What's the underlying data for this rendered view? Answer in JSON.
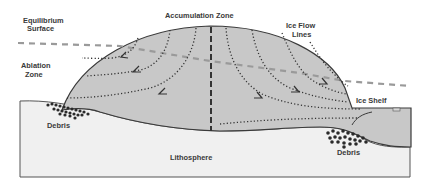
{
  "diagram": {
    "labels": {
      "equilibrium_surface_line1": "Equilibrium",
      "equilibrium_surface_line2": "Surface",
      "accumulation_zone": "Accumulation Zone",
      "ice_flow_lines_line1": "Ice Flow",
      "ice_flow_lines_line2": "Lines",
      "ablation_zone_line1": "Ablation",
      "ablation_zone_line2": "Zone",
      "ice_shelf": "Ice Shelf",
      "debris_left": "Debris",
      "debris_right": "Debris",
      "lithosphere": "Lithosphere"
    },
    "colors": {
      "ice": "#c8c8c8",
      "ice_outline": "#3a3a3a",
      "lithosphere": "#f0f0f0",
      "lithosphere_outline": "#555555",
      "equilibrium_line": "#9a9a9a",
      "flow_lines": "#333333",
      "debris": "#2a2a2a",
      "divide_line": "#333333"
    }
  }
}
